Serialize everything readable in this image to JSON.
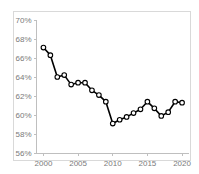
{
  "chart_data": {
    "type": "line",
    "title": "",
    "subtitle": "",
    "xlabel": "",
    "ylabel": "",
    "grid": false,
    "legend": null,
    "legend_position": "none",
    "xlim": [
      1999,
      2021
    ],
    "ylim": [
      56,
      70
    ],
    "ytick_values": [
      56,
      58,
      60,
      62,
      64,
      66,
      68,
      70
    ],
    "ytick_labels": [
      "56%",
      "58%",
      "60%",
      "62%",
      "64%",
      "66%",
      "68%",
      "70%"
    ],
    "xtick_values": [
      2000,
      2005,
      2010,
      2015,
      2020
    ],
    "xtick_labels": [
      "2000",
      "2005",
      "2010",
      "2015",
      "2020"
    ],
    "marker": "open-circle",
    "line_color": "#000000",
    "marker_face_color": "#ffffff",
    "marker_edge_color": "#000000",
    "axis_color": "#bfbfbf",
    "frame_color": "#d9d9d9",
    "tick_label_color": "#7a7a7a",
    "x": [
      2000,
      2001,
      2002,
      2003,
      2004,
      2005,
      2006,
      2007,
      2008,
      2009,
      2010,
      2011,
      2012,
      2013,
      2014,
      2015,
      2016,
      2017,
      2018,
      2019,
      2020
    ],
    "values": [
      67.1,
      66.3,
      64.0,
      64.2,
      63.2,
      63.4,
      63.4,
      62.6,
      62.1,
      61.4,
      59.1,
      59.5,
      59.8,
      60.2,
      60.6,
      61.4,
      60.7,
      59.9,
      60.3,
      61.4,
      61.3
    ],
    "series": [
      {
        "name": "series-1",
        "values": [
          67.1,
          66.3,
          64.0,
          64.2,
          63.2,
          63.4,
          63.4,
          62.6,
          62.1,
          61.4,
          59.1,
          59.5,
          59.8,
          60.2,
          60.6,
          61.4,
          60.7,
          59.9,
          60.3,
          61.4,
          61.3
        ]
      }
    ],
    "annotations": []
  }
}
